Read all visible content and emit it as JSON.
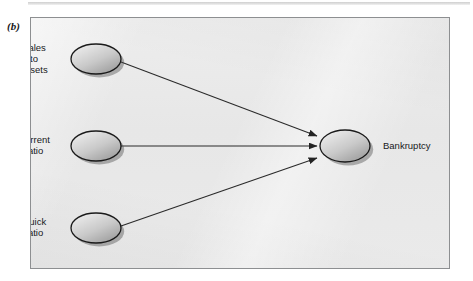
{
  "figure": {
    "panel_letter": "(b)",
    "caption_style": "serif-bold-italic"
  },
  "diagram": {
    "type": "neural-network-influence-diagram",
    "background_color": "#e9e9e9",
    "border_color": "#8d8f91",
    "node_fill_light": "#f0f0f0",
    "node_fill_dark": "#9a9a9a",
    "node_outline_color": "#1a1a1a",
    "edge_color": "#2a2a2a",
    "input_nodes": [
      {
        "id": "sales-to-assets",
        "label": "Sales\nto\nassets",
        "cx": 65,
        "cy": 41,
        "rx": 25,
        "ry": 15,
        "label_side": "left"
      },
      {
        "id": "current-ratio",
        "label": "Current\nratio",
        "cx": 65,
        "cy": 128,
        "rx": 25,
        "ry": 15,
        "label_side": "left"
      },
      {
        "id": "quick-ratio",
        "label": "Quick\nratio",
        "cx": 65,
        "cy": 210,
        "rx": 25,
        "ry": 15,
        "label_side": "left"
      }
    ],
    "output_node": {
      "id": "bankruptcy",
      "label": "Bankruptcy",
      "cx": 314,
      "cy": 128,
      "rx": 25,
      "ry": 16,
      "label_side": "right"
    },
    "edges": [
      {
        "from": "sales-to-assets",
        "to": "bankruptcy",
        "x1": 90,
        "y1": 44,
        "x2": 286,
        "y2": 118
      },
      {
        "from": "current-ratio",
        "to": "bankruptcy",
        "x1": 90,
        "y1": 128,
        "x2": 286,
        "y2": 128
      },
      {
        "from": "quick-ratio",
        "to": "bankruptcy",
        "x1": 90,
        "y1": 208,
        "x2": 286,
        "y2": 140
      }
    ]
  }
}
